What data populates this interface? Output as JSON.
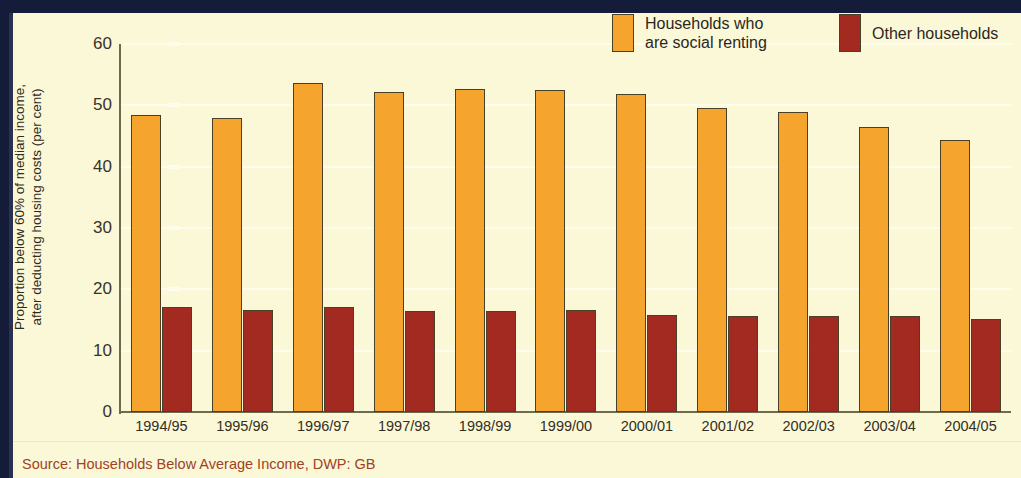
{
  "axis": {
    "y_title": "Proportion below 60% of median income,\nafter deducting housing costs (per cent)",
    "y_ticks": [
      "0",
      "10",
      "20",
      "30",
      "40",
      "50",
      "60"
    ]
  },
  "legend": {
    "items": [
      {
        "label": "Households who\nare social renting",
        "color": "#f5a42e",
        "key": "social"
      },
      {
        "label": "Other households",
        "color": "#a32a20",
        "key": "other"
      }
    ]
  },
  "source": {
    "text": "Source: Households Below Average Income, DWP: GB"
  },
  "chart_data": {
    "type": "bar",
    "title": "",
    "xlabel": "",
    "ylabel": "Proportion below 60% of median income, after deducting housing costs (per cent)",
    "ylim": [
      0,
      60
    ],
    "yticks": [
      0,
      10,
      20,
      30,
      40,
      50,
      60
    ],
    "grid": true,
    "legend_position": "top-right",
    "categories": [
      "1994/95",
      "1995/96",
      "1996/97",
      "1997/98",
      "1998/99",
      "1999/00",
      "2000/01",
      "2001/02",
      "2002/03",
      "2003/04",
      "2004/05"
    ],
    "series": [
      {
        "name": "Households who are social renting",
        "color": "#f5a42e",
        "values": [
          48.4,
          47.9,
          53.7,
          52.2,
          52.6,
          52.5,
          51.9,
          49.6,
          48.9,
          46.5,
          44.3
        ]
      },
      {
        "name": "Other households",
        "color": "#a32a20",
        "values": [
          17.1,
          16.7,
          17.1,
          16.5,
          16.5,
          16.6,
          15.8,
          15.6,
          15.7,
          15.6,
          15.1
        ]
      }
    ]
  }
}
